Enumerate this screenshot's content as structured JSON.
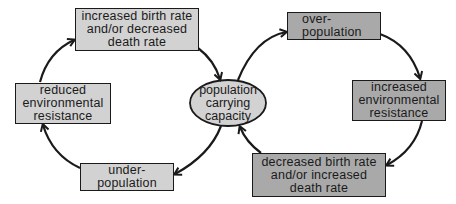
{
  "diagram": {
    "type": "cycle",
    "colors": {
      "left_cycle_fill": "#d2d2d2",
      "right_cycle_fill": "#a9a9a9",
      "center_fill": "#d2d2d2",
      "stroke": "#1a1a1a"
    },
    "center": {
      "label": "population\ncarrying\ncapacity"
    },
    "left_cycle": {
      "nodes": [
        {
          "id": "increased-birth-rate",
          "label": "increased birth rate\nand/or decreased\ndeath rate"
        },
        {
          "id": "under-population",
          "label": "under-\npopulation"
        },
        {
          "id": "reduced-environmental-resistance",
          "label": "reduced\nenvironmental\nresistance"
        }
      ]
    },
    "right_cycle": {
      "nodes": [
        {
          "id": "over-population",
          "label": "over-\npopulation"
        },
        {
          "id": "increased-environmental-resistance",
          "label": "increased\nenvironmental\nresistance"
        },
        {
          "id": "decreased-birth-rate",
          "label": "decreased birth rate\nand/or increased\ndeath rate"
        }
      ]
    },
    "edges": [
      {
        "from": "increased-birth-rate",
        "to": "population-carrying-capacity"
      },
      {
        "from": "population-carrying-capacity",
        "to": "under-population"
      },
      {
        "from": "under-population",
        "to": "reduced-environmental-resistance"
      },
      {
        "from": "reduced-environmental-resistance",
        "to": "increased-birth-rate"
      },
      {
        "from": "population-carrying-capacity",
        "to": "over-population"
      },
      {
        "from": "over-population",
        "to": "increased-environmental-resistance"
      },
      {
        "from": "increased-environmental-resistance",
        "to": "decreased-birth-rate"
      },
      {
        "from": "decreased-birth-rate",
        "to": "population-carrying-capacity"
      }
    ]
  }
}
